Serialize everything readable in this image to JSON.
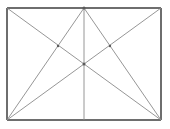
{
  "figure": {
    "canvas": {
      "width": 170,
      "height": 129,
      "background_color": "#ffffff"
    },
    "colors": {
      "frame_stroke": "#6e6e6e",
      "inner_stroke": "#8a8a8a",
      "vertex_fill": "#5a5a5a"
    },
    "rectangle": {
      "left": 7,
      "top": 8,
      "right": 161,
      "bottom": 120,
      "width": 154,
      "height": 112,
      "stroke_width": 1.4
    },
    "points": {
      "top_left": [
        7,
        8
      ],
      "top_center": [
        84,
        8
      ],
      "top_right": [
        161,
        8
      ],
      "bottom_left": [
        7,
        120
      ],
      "bottom_center": [
        84,
        120
      ],
      "bottom_right": [
        161,
        120
      ],
      "center": [
        84,
        64
      ],
      "left_mid_crossing": [
        58,
        46
      ],
      "right_mid_crossing": [
        110,
        46
      ]
    },
    "lines": [
      {
        "name": "rect-top-edge",
        "from": [
          7,
          8
        ],
        "to": [
          161,
          8
        ],
        "kind": "frame"
      },
      {
        "name": "rect-right-edge",
        "from": [
          161,
          8
        ],
        "to": [
          161,
          120
        ],
        "kind": "frame"
      },
      {
        "name": "rect-bottom-edge",
        "from": [
          161,
          120
        ],
        "to": [
          7,
          120
        ],
        "kind": "frame"
      },
      {
        "name": "rect-left-edge",
        "from": [
          7,
          120
        ],
        "to": [
          7,
          8
        ],
        "kind": "frame"
      },
      {
        "name": "vertical-midline",
        "from": [
          84,
          8
        ],
        "to": [
          84,
          120
        ],
        "kind": "inner"
      },
      {
        "name": "diagonal-topleft-to-bottomright",
        "from": [
          7,
          8
        ],
        "to": [
          161,
          120
        ],
        "kind": "inner"
      },
      {
        "name": "diagonal-topright-to-bottomleft",
        "from": [
          161,
          8
        ],
        "to": [
          7,
          120
        ],
        "kind": "inner"
      },
      {
        "name": "apex-to-bottomleft",
        "from": [
          84,
          8
        ],
        "to": [
          7,
          120
        ],
        "kind": "inner"
      },
      {
        "name": "apex-to-bottomright",
        "from": [
          84,
          8
        ],
        "to": [
          161,
          120
        ],
        "kind": "inner"
      }
    ],
    "vertices": [
      {
        "name": "apex-vertex",
        "at": [
          84,
          8
        ],
        "radius": 1.5
      },
      {
        "name": "center-vertex",
        "at": [
          84,
          64
        ],
        "radius": 1.5
      },
      {
        "name": "left-crossing-vertex",
        "at": [
          58,
          46
        ],
        "radius": 1.2
      },
      {
        "name": "right-crossing-vertex",
        "at": [
          110,
          46
        ],
        "radius": 1.2
      }
    ]
  }
}
